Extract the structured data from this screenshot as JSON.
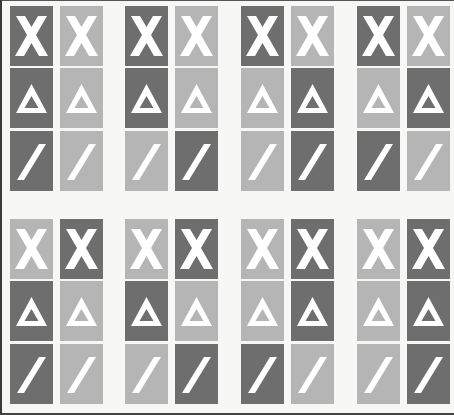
{
  "colors": {
    "dark": "#6e6e6e",
    "light": "#b5b5b5",
    "symbol": "#ffffff",
    "background": "#f7f7f5"
  },
  "symbols": [
    "x-symbol",
    "triangle-symbol",
    "slash-symbol"
  ],
  "groups": [
    {
      "id": 1,
      "x": 10,
      "y": 6,
      "pattern": [
        [
          "dark",
          "light"
        ],
        [
          "dark",
          "light"
        ],
        [
          "dark",
          "light"
        ]
      ]
    },
    {
      "id": 2,
      "x": 125,
      "y": 6,
      "pattern": [
        [
          "dark",
          "light"
        ],
        [
          "dark",
          "light"
        ],
        [
          "light",
          "dark"
        ]
      ]
    },
    {
      "id": 3,
      "x": 241,
      "y": 6,
      "pattern": [
        [
          "dark",
          "light"
        ],
        [
          "light",
          "dark"
        ],
        [
          "light",
          "dark"
        ]
      ]
    },
    {
      "id": 4,
      "x": 357,
      "y": 6,
      "pattern": [
        [
          "dark",
          "light"
        ],
        [
          "light",
          "dark"
        ],
        [
          "dark",
          "light"
        ]
      ]
    },
    {
      "id": 5,
      "x": 10,
      "y": 219,
      "pattern": [
        [
          "light",
          "dark"
        ],
        [
          "dark",
          "light"
        ],
        [
          "dark",
          "light"
        ]
      ]
    },
    {
      "id": 6,
      "x": 125,
      "y": 219,
      "pattern": [
        [
          "light",
          "dark"
        ],
        [
          "dark",
          "light"
        ],
        [
          "light",
          "dark"
        ]
      ]
    },
    {
      "id": 7,
      "x": 241,
      "y": 219,
      "pattern": [
        [
          "light",
          "dark"
        ],
        [
          "light",
          "dark"
        ],
        [
          "dark",
          "light"
        ]
      ]
    },
    {
      "id": 8,
      "x": 357,
      "y": 219,
      "pattern": [
        [
          "light",
          "dark"
        ],
        [
          "light",
          "dark"
        ],
        [
          "light",
          "dark"
        ]
      ]
    }
  ]
}
